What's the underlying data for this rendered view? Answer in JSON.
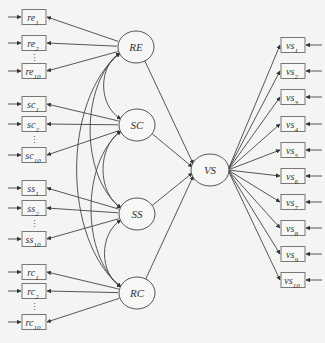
{
  "diagram": {
    "type": "structural-equation-model",
    "latent": [
      {
        "id": "RE",
        "label": "RE",
        "cx": 136,
        "cy": 47
      },
      {
        "id": "SC",
        "label": "SC",
        "cx": 137,
        "cy": 125
      },
      {
        "id": "SS",
        "label": "SS",
        "cx": 137,
        "cy": 214
      },
      {
        "id": "RC",
        "label": "RC",
        "cx": 137,
        "cy": 293
      },
      {
        "id": "VS",
        "label": "VS",
        "cx": 210,
        "cy": 170
      }
    ],
    "left_groups": [
      {
        "latent": "RE",
        "items": [
          {
            "base": "re",
            "sub": "1",
            "y": 17
          },
          {
            "base": "re",
            "sub": "2",
            "y": 43
          },
          {
            "base": "re",
            "sub": "10",
            "y": 71
          }
        ],
        "dots_y": 58
      },
      {
        "latent": "SC",
        "items": [
          {
            "base": "sc",
            "sub": "1",
            "y": 104
          },
          {
            "base": "sc",
            "sub": "2",
            "y": 124
          },
          {
            "base": "sc",
            "sub": "10",
            "y": 155
          }
        ],
        "dots_y": 140
      },
      {
        "latent": "SS",
        "items": [
          {
            "base": "ss",
            "sub": "1",
            "y": 188
          },
          {
            "base": "ss",
            "sub": "2",
            "y": 208
          },
          {
            "base": "ss",
            "sub": "10",
            "y": 239
          }
        ],
        "dots_y": 224
      },
      {
        "latent": "RC",
        "items": [
          {
            "base": "rc",
            "sub": "1",
            "y": 272
          },
          {
            "base": "rc",
            "sub": "2",
            "y": 291
          },
          {
            "base": "rc",
            "sub": "10",
            "y": 322
          }
        ],
        "dots_y": 307
      }
    ],
    "right_items": [
      {
        "base": "vs",
        "sub": "1",
        "y": 45
      },
      {
        "base": "vs",
        "sub": "2",
        "y": 71
      },
      {
        "base": "vs",
        "sub": "3",
        "y": 97
      },
      {
        "base": "vs",
        "sub": "4",
        "y": 124
      },
      {
        "base": "vs",
        "sub": "5",
        "y": 150
      },
      {
        "base": "vs",
        "sub": "6",
        "y": 176
      },
      {
        "base": "vs",
        "sub": "7",
        "y": 202
      },
      {
        "base": "vs",
        "sub": "8",
        "y": 228
      },
      {
        "base": "vs",
        "sub": "9",
        "y": 254
      },
      {
        "base": "vs",
        "sub": "10",
        "y": 280
      }
    ],
    "structural_paths": [
      [
        "RE",
        "VS"
      ],
      [
        "SC",
        "VS"
      ],
      [
        "SS",
        "VS"
      ],
      [
        "RC",
        "VS"
      ]
    ],
    "covariances": [
      [
        "RE",
        "SC"
      ],
      [
        "SC",
        "SS"
      ],
      [
        "SS",
        "RC"
      ],
      [
        "RE",
        "SS"
      ],
      [
        "SC",
        "RC"
      ],
      [
        "RE",
        "RC"
      ]
    ],
    "colors": {
      "line": "#444444",
      "box_stroke": "#777777",
      "background": "#f4f4f2"
    }
  }
}
